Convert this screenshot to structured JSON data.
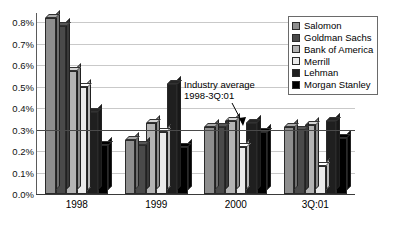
{
  "chart_data": {
    "type": "bar",
    "title": "",
    "xlabel": "",
    "ylabel": "",
    "categories": [
      "1998",
      "1999",
      "2000",
      "3Q:01"
    ],
    "ylim": [
      0,
      0.8
    ],
    "ytick_values": [
      0.8,
      0.7,
      0.6,
      0.5,
      0.4,
      0.3,
      0.2,
      0.1,
      0.0
    ],
    "ytick_labels": [
      "0.8%",
      "0.7%",
      "0.6%",
      "0.5%",
      "0.4%",
      "0.3%",
      "0.2%",
      "0.1%",
      "0.0%"
    ],
    "grid": true,
    "grid_axis": "y",
    "legend_position": "top-right",
    "series": [
      {
        "name": "Salomon",
        "color": "#8e8e8e",
        "values": [
          0.82,
          0.25,
          0.31,
          0.31
        ]
      },
      {
        "name": "Goldman Sachs",
        "color": "#4a4a4a",
        "values": [
          0.78,
          0.23,
          0.31,
          0.3
        ]
      },
      {
        "name": "Bank of America",
        "color": "#b4b4b4",
        "values": [
          0.57,
          0.33,
          0.34,
          0.32
        ]
      },
      {
        "name": "Merrill",
        "color": "#ebebeb",
        "values": [
          0.5,
          0.29,
          0.22,
          0.13
        ]
      },
      {
        "name": "Lehman",
        "color": "#1f1f1f",
        "values": [
          0.38,
          0.51,
          0.33,
          0.34
        ]
      },
      {
        "name": "Morgan Stanley",
        "color": "#000000",
        "values": [
          0.23,
          0.22,
          0.29,
          0.26
        ]
      }
    ],
    "reference_line": {
      "label": "Industry average",
      "sublabel": "1998-3Q:01",
      "value": 0.3,
      "orientation": "horizontal"
    }
  },
  "annotation": {
    "line1": "Industry average",
    "line2": "1998-3Q:01"
  }
}
